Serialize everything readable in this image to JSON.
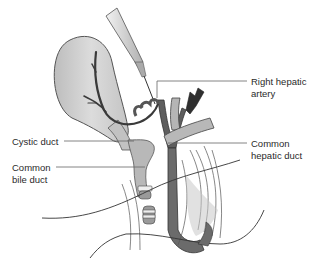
{
  "figure": {
    "labels": [
      {
        "id": "right-hepatic-artery",
        "text": "Right hepatic\nartery"
      },
      {
        "id": "cystic-duct",
        "text": "Cystic duct"
      },
      {
        "id": "common-hepatic-duct",
        "text": "Common\nhepatic duct"
      },
      {
        "id": "common-bile-duct",
        "text": "Common\nbile duct"
      }
    ]
  },
  "colors": {
    "gallbladder": "#cfcfcf",
    "duct": "#b8b8b8",
    "artery_dark": "#3a3a3a",
    "vessel_mid": "#6e6e6e",
    "leader": "#666666",
    "text": "#2a2a2a"
  }
}
